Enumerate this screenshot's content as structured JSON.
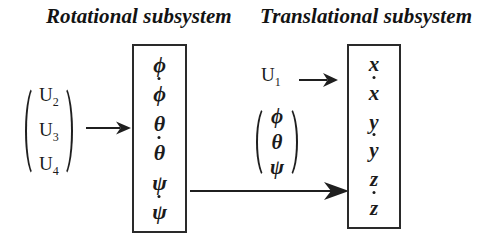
{
  "diagram": {
    "type": "block-diagram",
    "background_color": "#ffffff",
    "line_color": "#1f1f1f"
  },
  "rotational": {
    "title": "Rotational subsystem",
    "input_vector": {
      "name": "control-inputs",
      "entries": [
        {
          "base": "U",
          "sub": "2"
        },
        {
          "base": "U",
          "sub": "3"
        },
        {
          "base": "U",
          "sub": "4"
        }
      ]
    },
    "input_arrow": "arrow-right",
    "outputs": [
      {
        "symbol": "ϕ",
        "dot": false,
        "label": "phi"
      },
      {
        "symbol": "ϕ",
        "dot": true,
        "label": "phi-dot"
      },
      {
        "symbol": "θ",
        "dot": false,
        "label": "theta"
      },
      {
        "symbol": "θ",
        "dot": true,
        "label": "theta-dot"
      },
      {
        "symbol": "ψ",
        "dot": false,
        "label": "psi"
      },
      {
        "symbol": "ψ",
        "dot": true,
        "label": "psi-dot"
      }
    ]
  },
  "translational": {
    "title": "Translational subsystem",
    "input_scalar": {
      "base": "U",
      "sub": "1"
    },
    "input_vector": {
      "name": "attitude-angles",
      "entries": [
        {
          "symbol": "ϕ",
          "label": "phi"
        },
        {
          "symbol": "θ",
          "label": "theta"
        },
        {
          "symbol": "ψ",
          "label": "psi"
        }
      ]
    },
    "input_arrow": "arrow-right",
    "coupling_arrow": "arrow-right-long",
    "outputs": [
      {
        "symbol": "x",
        "dot": false,
        "label": "x"
      },
      {
        "symbol": "x",
        "dot": true,
        "label": "x-dot"
      },
      {
        "symbol": "y",
        "dot": false,
        "label": "y"
      },
      {
        "symbol": "y",
        "dot": true,
        "label": "y-dot"
      },
      {
        "symbol": "z",
        "dot": false,
        "label": "z"
      },
      {
        "symbol": "z",
        "dot": true,
        "label": "z-dot"
      }
    ]
  }
}
